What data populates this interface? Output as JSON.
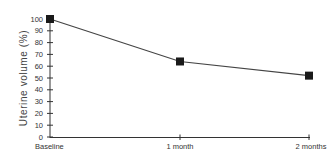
{
  "chart_data": {
    "type": "line",
    "title": "",
    "xlabel": "",
    "ylabel": "Uterine volume (%)",
    "categories": [
      "Baseline",
      "1 month",
      "2 months"
    ],
    "series": [
      {
        "name": "Uterine volume",
        "values": [
          100,
          64,
          52
        ],
        "marker": "square",
        "color": "#222222"
      }
    ],
    "ylim": [
      0,
      100
    ],
    "yticks": [
      0,
      10,
      20,
      30,
      40,
      50,
      60,
      70,
      80,
      90,
      100
    ],
    "grid": false,
    "legend": null
  },
  "colors": {
    "line": "#444444",
    "marker": "#1a1a1a",
    "axis": "#333333",
    "text": "#333333"
  }
}
